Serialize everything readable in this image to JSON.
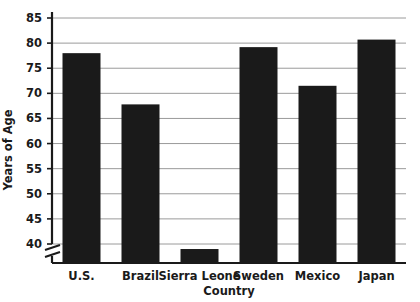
{
  "chart_data": {
    "type": "bar",
    "title": "",
    "xlabel": "Country",
    "ylabel": "Years of Age",
    "categories": [
      "U.S.",
      "Brazil",
      "Sierra Leone",
      "Sweden",
      "Mexico",
      "Japan"
    ],
    "values": [
      78.0,
      67.8,
      39.0,
      79.2,
      71.5,
      80.7
    ],
    "series": [
      {
        "name": "Life expectancy",
        "values": [
          78.0,
          67.8,
          39.0,
          79.2,
          71.5,
          80.7
        ]
      }
    ],
    "ylim": [
      37.5,
      87.5
    ],
    "yticks": [
      40,
      45,
      50,
      55,
      60,
      65,
      70,
      75,
      80,
      85
    ],
    "ytick_labels": [
      "40",
      "45",
      "50",
      "55",
      "60",
      "65",
      "70",
      "75",
      "80",
      "85"
    ],
    "grid": true,
    "grid_axis": "y",
    "legend": "none",
    "axis_break": true,
    "axis_break_note": "y-axis broken below 40",
    "bar_color": "#1a1a1a",
    "grid_color": "#9a9a9a",
    "axis_color": "#1a1a1a",
    "background_color": "#ffffff"
  },
  "colors": {
    "bar": "#1a1a1a",
    "grid": "#9a9a9a",
    "axis": "#1a1a1a",
    "text": "#1a1a1a",
    "background": "#ffffff"
  }
}
